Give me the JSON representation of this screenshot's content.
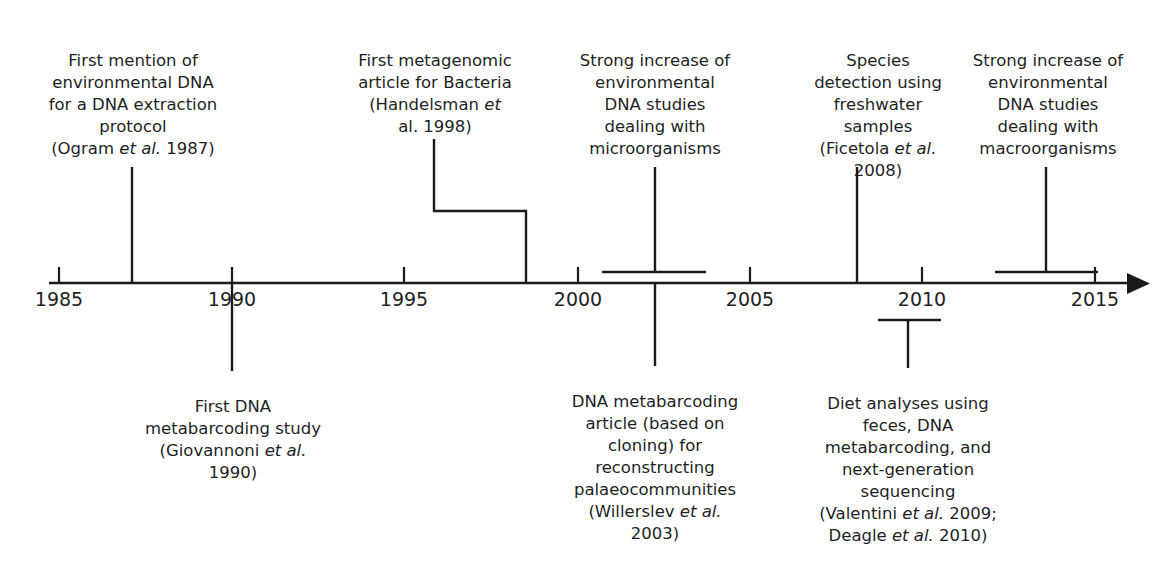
{
  "figure": {
    "type": "timeline",
    "orientation": "horizontal",
    "axis": {
      "start_year": 1985,
      "end_year": 2015,
      "tick_years": [
        1985,
        1990,
        1995,
        2000,
        2005,
        2010,
        2015
      ],
      "tick_labels": [
        "1985",
        "1990",
        "1995",
        "2000",
        "2005",
        "2010",
        "2015"
      ],
      "has_arrow_head": true,
      "arrow_direction": "right",
      "line_color": "#1a1a1a"
    }
  },
  "events_above": [
    {
      "id": "ogram-1987",
      "text": "First mention of\nenvironmental DNA\nfor a DNA extraction\nprotocol\n(Ogram ",
      "text_italic": "et al.",
      "text_tail": " 1987)",
      "year": 1987,
      "connector": "line"
    },
    {
      "id": "handelsman-1998",
      "text": "First metagenomic\narticle for Bacteria\n(Handelsman ",
      "text_italic": "et",
      "text_tail": "\nal. 1998)",
      "year": 1998,
      "connector": "stepped"
    },
    {
      "id": "microorganisms-increase",
      "text": "Strong increase of\nenvironmental\nDNA studies\ndealing with\nmicroorganisms",
      "text_italic": "",
      "text_tail": "",
      "year_start": 2001,
      "year_end": 2004,
      "connector": "bracket"
    },
    {
      "id": "ficetola-2008",
      "text": "Species\ndetection using\nfreshwater\nsamples\n(Ficetola ",
      "text_italic": "et al.",
      "text_tail": "\n2008)",
      "year": 2008,
      "connector": "line"
    },
    {
      "id": "macroorganisms-increase",
      "text": "Strong increase of\nenvironmental\nDNA studies\ndealing with\nmacroorganisms",
      "text_italic": "",
      "text_tail": "",
      "year_start": 2012,
      "year_end": 2015,
      "connector": "bracket"
    }
  ],
  "events_below": [
    {
      "id": "giovannoni-1990",
      "text": "First DNA\nmetabarcoding study\n(Giovannoni ",
      "text_italic": "et al.",
      "text_tail": "\n1990)",
      "year": 1990,
      "connector": "line"
    },
    {
      "id": "willerslev-2003",
      "text": "DNA metabarcoding\narticle (based on\ncloning) for\nreconstructing\npalaeocommunities\n(Willerslev ",
      "text_italic": "et al.",
      "text_tail": "\n2003)",
      "year": 2003,
      "connector": "line"
    },
    {
      "id": "valentini-deagle",
      "text": "Diet analyses using\nfeces, DNA\nmetabarcoding, and\nnext-generation\nsequencing\n(Valentini ",
      "text_italic": "et al.",
      "text_tail": " 2009;\nDeagle ",
      "text_italic2": "et al.",
      "text_tail2": " 2010)",
      "year_start": 2009,
      "year_end": 2010,
      "connector": "bracket"
    }
  ]
}
